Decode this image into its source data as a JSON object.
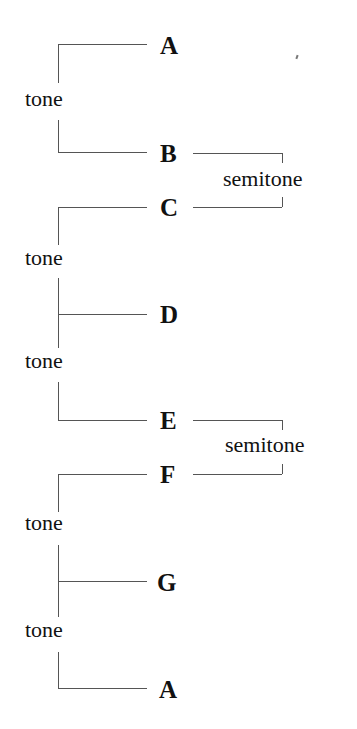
{
  "diagram": {
    "type": "musical-scale-intervals",
    "notes": [
      "A",
      "B",
      "C",
      "D",
      "E",
      "F",
      "G",
      "A"
    ],
    "intervals": [
      {
        "from": "A",
        "to": "B",
        "label": "tone"
      },
      {
        "from": "B",
        "to": "C",
        "label": "semitone"
      },
      {
        "from": "C",
        "to": "D",
        "label": "tone"
      },
      {
        "from": "D",
        "to": "E",
        "label": "tone"
      },
      {
        "from": "E",
        "to": "F",
        "label": "semitone"
      },
      {
        "from": "F",
        "to": "G",
        "label": "tone"
      },
      {
        "from": "G",
        "to": "A",
        "label": "tone"
      }
    ],
    "line_color": "#555555",
    "text_color": "#111111"
  }
}
